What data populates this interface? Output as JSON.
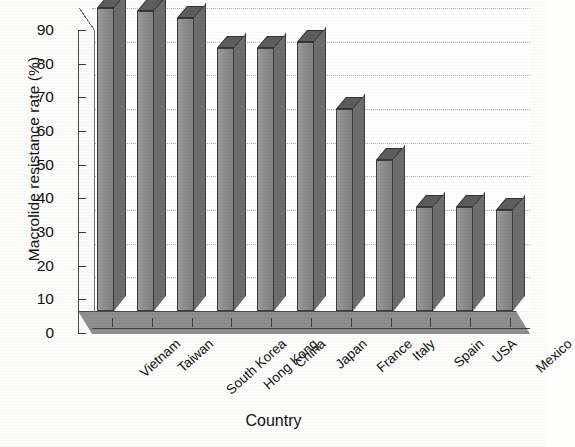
{
  "chart_data": {
    "type": "bar",
    "title": "",
    "xlabel": "Country",
    "ylabel": "Macrolide resistance rate (%)",
    "categories": [
      "Vietnam",
      "Taiwan",
      "South Korea",
      "Hong Kong",
      "China",
      "Japan",
      "France",
      "Italy",
      "Spain",
      "USA",
      "Mexico"
    ],
    "values": [
      90,
      89,
      87,
      78,
      78,
      80,
      60,
      45,
      31,
      31,
      30
    ],
    "ylim": [
      0,
      90
    ],
    "ytick_labels": [
      "90",
      "80",
      "70",
      "60",
      "50",
      "40",
      "30",
      "20",
      "10",
      "0"
    ],
    "ytick_values": [
      90,
      80,
      70,
      60,
      50,
      40,
      30,
      20,
      10,
      0
    ],
    "grid": true,
    "legend": "none",
    "style_3d": true,
    "bar_color": "#8d8d8d",
    "bar_edge_color": "#3c3c3c",
    "floor_color": "#8e8e8e",
    "gridline_color": "#b2b2b2",
    "background_color": "#fdfdfb"
  },
  "axes": {
    "y_title": "Macrolide resistance rate (%)",
    "x_title": "Country"
  }
}
